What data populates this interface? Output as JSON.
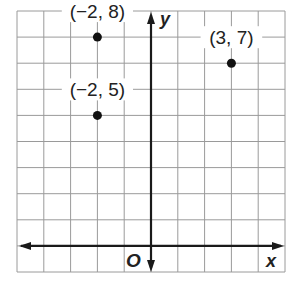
{
  "chart_data": {
    "type": "scatter",
    "title": "",
    "xlabel": "x",
    "ylabel": "y",
    "origin_label": "O",
    "xlim": [
      -5,
      5
    ],
    "ylim": [
      -1,
      9
    ],
    "grid": true,
    "grid_step": 1,
    "points": [
      {
        "x": -2,
        "y": 8,
        "label": "(−2, 8)",
        "label_pos": "above"
      },
      {
        "x": -2,
        "y": 5,
        "label": "(−2, 5)",
        "label_pos": "above"
      },
      {
        "x": 3,
        "y": 7,
        "label": "(3, 7)",
        "label_pos": "above"
      }
    ],
    "colors": {
      "point": "#111111",
      "axis": "#1a1a1a",
      "grid": "#9a9a9a"
    }
  }
}
